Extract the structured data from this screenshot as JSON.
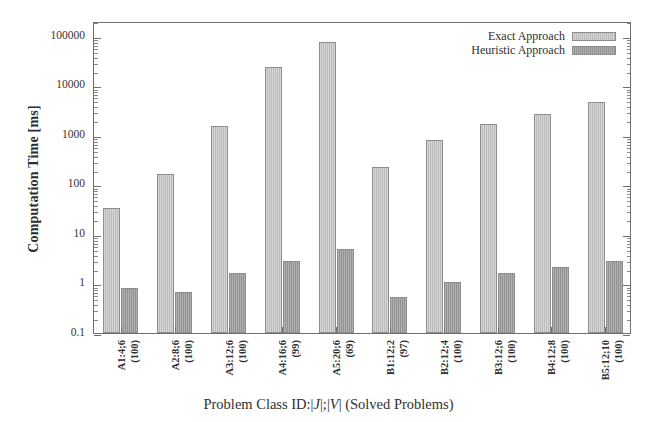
{
  "chart_data": {
    "type": "bar",
    "title": "",
    "xlabel": "Problem Class ID:|J|;|V| (Solved Problems)",
    "xlabel_parts": {
      "pre": "Problem Class ID:|",
      "j": "J",
      "mid": "|;|",
      "v": "V",
      "post": "| (Solved Problems)"
    },
    "ylabel": "Computation Time [ms]",
    "yscale": "log",
    "ylim": [
      0.1,
      200000
    ],
    "ytick_labels": [
      "0.1",
      "1",
      "10",
      "100",
      "1000",
      "10000",
      "100000"
    ],
    "ytick_values": [
      0.1,
      1,
      10,
      100,
      1000,
      10000,
      100000
    ],
    "grid": false,
    "legend_position": "top-right",
    "categories": [
      "A1:4;6",
      "A2:8;6",
      "A3:12;6",
      "A4:16;6",
      "A5:20;6",
      "B1:12;2",
      "B2:12;4",
      "B3:12;6",
      "B4:12;8",
      "B5:12;10"
    ],
    "solved_problems": [
      "(100)",
      "(100)",
      "(100)",
      "(99)",
      "(69)",
      "(97)",
      "(100)",
      "(100)",
      "(100)",
      "(100)"
    ],
    "series": [
      {
        "name": "Exact Approach",
        "color": "#c3c3c3",
        "values": [
          34,
          160,
          1550,
          24000,
          75000,
          225,
          800,
          1700,
          2600,
          4700
        ]
      },
      {
        "name": "Heuristic Approach",
        "color": "#9a9a9a",
        "values": [
          0.82,
          0.68,
          1.6,
          2.9,
          4.9,
          0.54,
          1.05,
          1.65,
          2.2,
          2.8
        ]
      }
    ]
  },
  "legend": {
    "items": [
      {
        "label": "Exact Approach",
        "swatch": "exact"
      },
      {
        "label": "Heuristic Approach",
        "swatch": "heuristic"
      }
    ]
  }
}
